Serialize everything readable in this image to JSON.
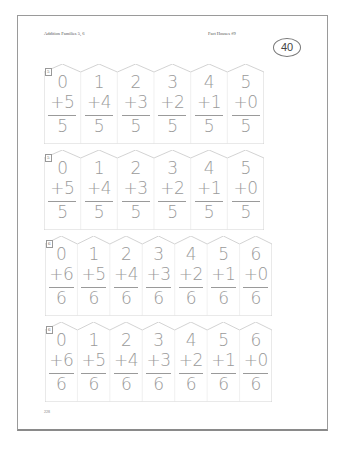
{
  "header": {
    "left": "Addition Families 5, 6",
    "right": "Fact Houses #9",
    "page_badge": "40"
  },
  "strips": [
    {
      "label": "5",
      "sum": "5",
      "top": 0,
      "facts": [
        [
          "0",
          "+5",
          "5"
        ],
        [
          "1",
          "+4",
          "5"
        ],
        [
          "2",
          "+3",
          "5"
        ],
        [
          "3",
          "+2",
          "5"
        ],
        [
          "4",
          "+1",
          "5"
        ],
        [
          "5",
          "+0",
          "5"
        ]
      ]
    },
    {
      "label": "5",
      "sum": "5",
      "top": 0,
      "facts": [
        [
          "0",
          "+5",
          "5"
        ],
        [
          "1",
          "+4",
          "5"
        ],
        [
          "2",
          "+3",
          "5"
        ],
        [
          "3",
          "+2",
          "5"
        ],
        [
          "4",
          "+1",
          "5"
        ],
        [
          "5",
          "+0",
          "5"
        ]
      ]
    },
    {
      "label": "6",
      "sum": "6",
      "top": 0,
      "facts": [
        [
          "0",
          "+6",
          "6"
        ],
        [
          "1",
          "+5",
          "6"
        ],
        [
          "2",
          "+4",
          "6"
        ],
        [
          "3",
          "+3",
          "6"
        ],
        [
          "4",
          "+2",
          "6"
        ],
        [
          "5",
          "+1",
          "6"
        ],
        [
          "6",
          "+0",
          "6"
        ]
      ]
    },
    {
      "label": "6",
      "sum": "6",
      "top": 0,
      "facts": [
        [
          "0",
          "+6",
          "6"
        ],
        [
          "1",
          "+5",
          "6"
        ],
        [
          "2",
          "+4",
          "6"
        ],
        [
          "3",
          "+3",
          "6"
        ],
        [
          "4",
          "+2",
          "6"
        ],
        [
          "5",
          "+1",
          "6"
        ],
        [
          "6",
          "+0",
          "6"
        ]
      ]
    }
  ],
  "footer": {
    "page_number": "228"
  },
  "colors": {
    "digit": "#9a9a9a",
    "outline": "#c8c8c8"
  }
}
